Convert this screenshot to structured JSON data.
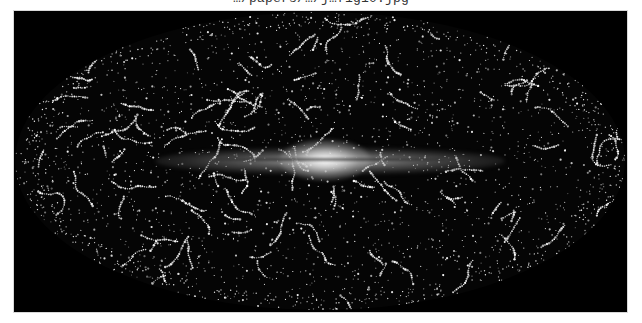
{
  "caption": {
    "text": "…/papers/…/j…f1g10.jpg"
  },
  "image": {
    "subject": "all-sky-galaxy-distribution-map",
    "projection": "aitoff-ellipse",
    "background_color": "#000000",
    "point_color": "#ffffff",
    "band_color": "#d9d9d9",
    "page_background": "#ffffff"
  }
}
